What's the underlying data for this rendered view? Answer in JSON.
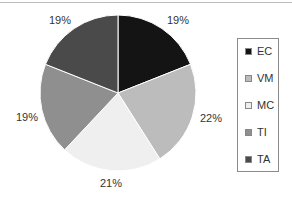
{
  "chart_data": {
    "type": "pie",
    "title": "",
    "categories": [
      "EC",
      "VM",
      "MC",
      "TI",
      "TA"
    ],
    "values": [
      19,
      22,
      21,
      19,
      19
    ],
    "labels": [
      "19%",
      "22%",
      "21%",
      "19%",
      "19%"
    ],
    "colors": [
      "#141414",
      "#bcbcbc",
      "#efefef",
      "#8f8f8f",
      "#4a4a4a"
    ],
    "legend_position": "right",
    "start_angle": "12 o'clock, clockwise"
  },
  "legend": {
    "items": [
      {
        "label": "EC",
        "color": "#141414"
      },
      {
        "label": "VM",
        "color": "#bcbcbc"
      },
      {
        "label": "MC",
        "color": "#efefef"
      },
      {
        "label": "TI",
        "color": "#8f8f8f"
      },
      {
        "label": "TA",
        "color": "#4a4a4a"
      }
    ]
  },
  "slice_labels": {
    "ec": "19%",
    "vm": "22%",
    "mc": "21%",
    "ti": "19%",
    "ta": "19%"
  }
}
